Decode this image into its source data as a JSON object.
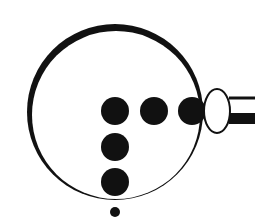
{
  "diagram": {
    "title": "Circle with dot arrangement and tube attachment",
    "colors": {
      "background": "#ffffff",
      "ink": "#111111",
      "oval_fill": "#ffffff"
    },
    "outer_circle": {
      "cx": 115,
      "cy": 112,
      "r": 88,
      "inner_cx": 116,
      "inner_cy": 115,
      "inner_r": 84
    },
    "dots": [
      {
        "id": "dot-center",
        "cx": 115,
        "cy": 111,
        "r": 14
      },
      {
        "id": "dot-right-1",
        "cx": 154,
        "cy": 111,
        "r": 14
      },
      {
        "id": "dot-right-2",
        "cx": 192,
        "cy": 111,
        "r": 14
      },
      {
        "id": "dot-down-1",
        "cx": 115,
        "cy": 147,
        "r": 14
      },
      {
        "id": "dot-down-2",
        "cx": 115,
        "cy": 182,
        "r": 14
      }
    ],
    "small_dot": {
      "cx": 115,
      "cy": 212,
      "r": 5
    },
    "oval": {
      "cx": 217,
      "cy": 111,
      "rx": 13,
      "ry": 22,
      "stroke_width": 2
    },
    "tube": {
      "top_line": {
        "x1": 229,
        "y1": 98,
        "x2": 255,
        "y2": 98,
        "width": 3
      },
      "bottom_bar": {
        "x": 229,
        "y": 113,
        "width": 26,
        "height": 11
      }
    }
  }
}
